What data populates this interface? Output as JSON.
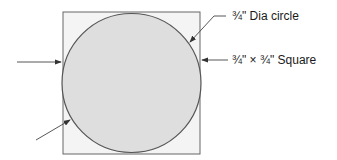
{
  "diagram": {
    "labels": {
      "circle": "¾\" Dia circle",
      "square": "¾\" × ¾\" Square"
    },
    "colors": {
      "square_fill": "#f4f4f4",
      "circle_fill": "#dedede",
      "stroke": "#555555"
    }
  }
}
